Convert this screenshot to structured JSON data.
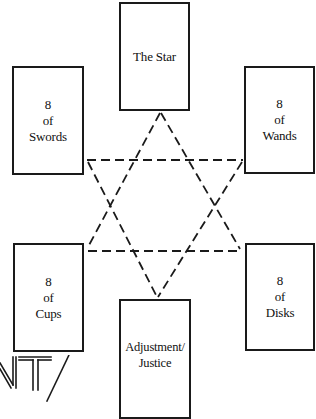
{
  "diagram": {
    "type": "hexagram-tarot-spread",
    "line_style": "dashed",
    "line_color": "#1a1a1a",
    "cards": [
      {
        "id": "top",
        "position": "top",
        "lines": [
          "The Star"
        ]
      },
      {
        "id": "upper-left",
        "position": "upper-left",
        "lines": [
          "8",
          "of",
          "Swords"
        ]
      },
      {
        "id": "upper-right",
        "position": "upper-right",
        "lines": [
          "8",
          "of",
          "Wands"
        ]
      },
      {
        "id": "lower-left",
        "position": "lower-left",
        "lines": [
          "8",
          "of",
          "Cups"
        ]
      },
      {
        "id": "lower-right",
        "position": "lower-right",
        "lines": [
          "8",
          "of",
          "Disks"
        ]
      },
      {
        "id": "bottom",
        "position": "bottom",
        "lines": [
          "Adjustment/",
          "Justice"
        ]
      }
    ],
    "fragment_text": "NT/"
  }
}
